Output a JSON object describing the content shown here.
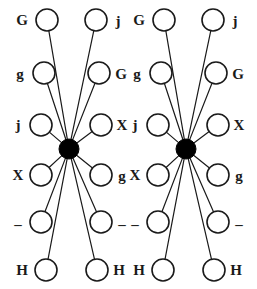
{
  "figure": {
    "type": "graph-diagram",
    "background_color": "#ffffff",
    "stroke_color": "#1a1a1a",
    "hub_fill_color": "#000000",
    "node_fill_color": "#ffffff",
    "node_radius": 11,
    "hub_radius": 10,
    "edge_width": 1.2,
    "node_stroke_width": 1.6
  },
  "graphs": [
    {
      "name": "left-star-graph",
      "hub": {
        "name": "left-hub",
        "cx": 69,
        "cy": 149
      },
      "nodes": [
        {
          "id": "L-left-1",
          "label": "G",
          "cx": 47,
          "cy": 20,
          "label_x": 22,
          "label_y": 20,
          "side": "left"
        },
        {
          "id": "L-left-2",
          "label": "g",
          "cx": 44,
          "cy": 73,
          "label_x": 20,
          "label_y": 74,
          "side": "left"
        },
        {
          "id": "L-left-3",
          "label": "j",
          "cx": 41,
          "cy": 125,
          "label_x": 18,
          "label_y": 125,
          "side": "left"
        },
        {
          "id": "L-left-4",
          "label": "X",
          "cx": 41,
          "cy": 175,
          "label_x": 18,
          "label_y": 175,
          "side": "left"
        },
        {
          "id": "L-left-5",
          "label": "–",
          "cx": 41,
          "cy": 222,
          "label_x": 18,
          "label_y": 224,
          "side": "left"
        },
        {
          "id": "L-left-6",
          "label": "H",
          "cx": 46,
          "cy": 270,
          "label_x": 22,
          "label_y": 270,
          "side": "left"
        },
        {
          "id": "L-right-1",
          "label": "j",
          "cx": 96,
          "cy": 20,
          "label_x": 118,
          "label_y": 21,
          "side": "right"
        },
        {
          "id": "L-right-2",
          "label": "G",
          "cx": 99,
          "cy": 73,
          "label_x": 121,
          "label_y": 74,
          "side": "right"
        },
        {
          "id": "L-right-3",
          "label": "X",
          "cx": 101,
          "cy": 125,
          "label_x": 122,
          "label_y": 125,
          "side": "right"
        },
        {
          "id": "L-right-4",
          "label": "g",
          "cx": 101,
          "cy": 175,
          "label_x": 122,
          "label_y": 176,
          "side": "right"
        },
        {
          "id": "L-right-5",
          "label": "–",
          "cx": 101,
          "cy": 222,
          "label_x": 122,
          "label_y": 224,
          "side": "right"
        },
        {
          "id": "L-right-6",
          "label": "H",
          "cx": 97,
          "cy": 270,
          "label_x": 119,
          "label_y": 270,
          "side": "right"
        }
      ]
    },
    {
      "name": "right-star-graph",
      "hub": {
        "name": "right-hub",
        "cx": 186,
        "cy": 149
      },
      "nodes": [
        {
          "id": "R-left-1",
          "label": "G",
          "cx": 164,
          "cy": 20,
          "label_x": 139,
          "label_y": 20,
          "side": "left"
        },
        {
          "id": "R-left-2",
          "label": "g",
          "cx": 161,
          "cy": 73,
          "label_x": 137,
          "label_y": 74,
          "side": "left"
        },
        {
          "id": "R-left-3",
          "label": "j",
          "cx": 158,
          "cy": 125,
          "label_x": 135,
          "label_y": 125,
          "side": "left"
        },
        {
          "id": "R-left-4",
          "label": "X",
          "cx": 158,
          "cy": 175,
          "label_x": 135,
          "label_y": 175,
          "side": "left"
        },
        {
          "id": "R-left-5",
          "label": "–",
          "cx": 158,
          "cy": 222,
          "label_x": 135,
          "label_y": 224,
          "side": "left"
        },
        {
          "id": "R-left-6",
          "label": "H",
          "cx": 163,
          "cy": 270,
          "label_x": 139,
          "label_y": 270,
          "side": "left"
        },
        {
          "id": "R-right-1",
          "label": "j",
          "cx": 213,
          "cy": 20,
          "label_x": 235,
          "label_y": 21,
          "side": "right"
        },
        {
          "id": "R-right-2",
          "label": "G",
          "cx": 216,
          "cy": 73,
          "label_x": 238,
          "label_y": 74,
          "side": "right"
        },
        {
          "id": "R-right-3",
          "label": "X",
          "cx": 218,
          "cy": 125,
          "label_x": 239,
          "label_y": 125,
          "side": "right"
        },
        {
          "id": "R-right-4",
          "label": "g",
          "cx": 218,
          "cy": 175,
          "label_x": 239,
          "label_y": 176,
          "side": "right"
        },
        {
          "id": "R-right-5",
          "label": "–",
          "cx": 218,
          "cy": 222,
          "label_x": 239,
          "label_y": 224,
          "side": "right"
        },
        {
          "id": "R-right-6",
          "label": "H",
          "cx": 214,
          "cy": 270,
          "label_x": 236,
          "label_y": 270,
          "side": "right"
        }
      ]
    }
  ]
}
